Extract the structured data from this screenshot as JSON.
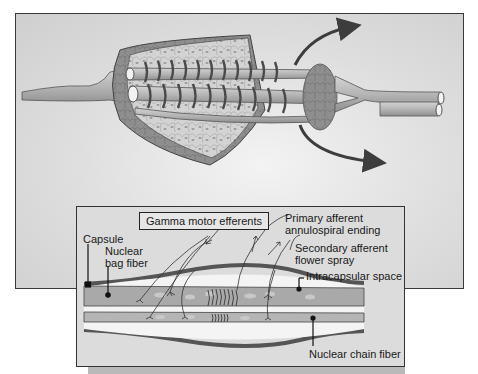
{
  "figure": {
    "colors": {
      "background": "#dedede",
      "fiber": "#b8b8b8",
      "capsule": "#8a8a8a",
      "spiral": "#4a4a4a",
      "arrow": "#3d3d3d",
      "frame": "#333333"
    }
  },
  "top_illustration": {
    "description": "3D cutaway of muscle spindle with annulospiral nerve endings wrapped around intrafusal fibers and curved arrows"
  },
  "inset": {
    "labels": {
      "gamma_motor": "Gamma motor efferents",
      "primary_afferent_line1": "Primary afferent",
      "primary_afferent_line2": "annulospiral ending",
      "secondary_afferent_line1": "Secondary afferent",
      "secondary_afferent_line2": "flower spray",
      "intracapsular": "Intracapsular space",
      "capsule": "Capsule",
      "nuclear_bag_line1": "Nuclear",
      "nuclear_bag_line2": "bag fiber",
      "nuclear_chain": "Nuclear chain fiber"
    }
  }
}
